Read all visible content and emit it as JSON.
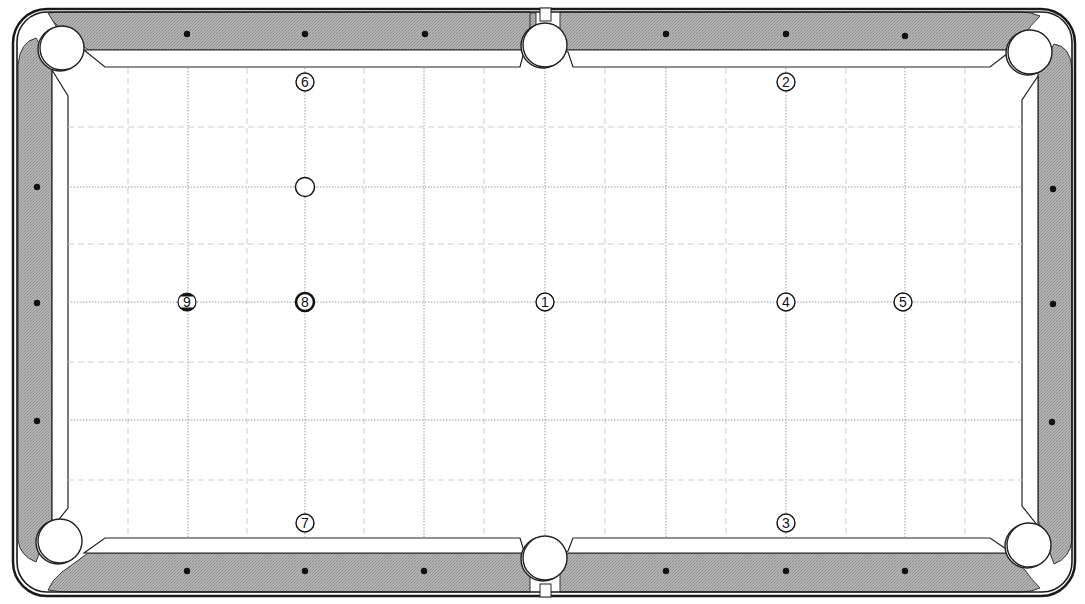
{
  "diagram": {
    "type": "pool-table-layout",
    "colors": {
      "rail": "#a8a8a8",
      "rail_dark": "#8c8c8c",
      "outline": "#1a1a1a",
      "cloth": "#ffffff",
      "grid_major": "#9a9a9a",
      "grid_minor": "#cfcfcf",
      "diamond": "#111111"
    },
    "table": {
      "playfield": {
        "x": 68,
        "y": 68,
        "w": 954,
        "h": 470
      },
      "grid": {
        "major_x": [
          188,
          305,
          424,
          545,
          666,
          786,
          905
        ],
        "minor_x": [
          128,
          247,
          364,
          484,
          605,
          726,
          846,
          965
        ],
        "major_y": [
          187,
          302,
          420
        ],
        "minor_y": [
          127,
          244,
          362,
          480
        ]
      },
      "diamonds": {
        "top": [
          [
            187,
            34
          ],
          [
            305,
            34
          ],
          [
            425,
            34
          ],
          [
            666,
            34
          ],
          [
            786,
            34
          ],
          [
            905,
            36
          ]
        ],
        "bottom": [
          [
            187,
            571
          ],
          [
            305,
            571
          ],
          [
            424,
            571
          ],
          [
            666,
            571
          ],
          [
            786,
            571
          ],
          [
            905,
            571
          ]
        ],
        "left": [
          [
            37,
            187
          ],
          [
            37,
            303
          ],
          [
            37,
            421
          ]
        ],
        "right": [
          [
            1053,
            189
          ],
          [
            1053,
            304
          ],
          [
            1052,
            422
          ]
        ]
      },
      "pockets": [
        {
          "name": "top-left",
          "cx": 62,
          "cy": 48,
          "r": 22
        },
        {
          "name": "top-side",
          "cx": 545,
          "cy": 45,
          "r": 22
        },
        {
          "name": "top-right",
          "cx": 1030,
          "cy": 52,
          "r": 22
        },
        {
          "name": "bottom-left",
          "cx": 60,
          "cy": 541,
          "r": 22
        },
        {
          "name": "bottom-side",
          "cx": 545,
          "cy": 558,
          "r": 22
        },
        {
          "name": "bottom-right",
          "cx": 1029,
          "cy": 545,
          "r": 22
        }
      ]
    },
    "balls": [
      {
        "label": "1",
        "x": 545,
        "y": 302,
        "style": "solid"
      },
      {
        "label": "2",
        "x": 786,
        "y": 82,
        "style": "solid"
      },
      {
        "label": "3",
        "x": 786,
        "y": 523,
        "style": "solid"
      },
      {
        "label": "4",
        "x": 786,
        "y": 302,
        "style": "solid"
      },
      {
        "label": "5",
        "x": 903,
        "y": 302,
        "style": "solid"
      },
      {
        "label": "6",
        "x": 305,
        "y": 82,
        "style": "solid"
      },
      {
        "label": "7",
        "x": 305,
        "y": 523,
        "style": "solid"
      },
      {
        "label": "8",
        "x": 305,
        "y": 302,
        "style": "eight"
      },
      {
        "label": "9",
        "x": 187,
        "y": 302,
        "style": "stripe"
      }
    ],
    "cue_ball": {
      "label": "",
      "x": 305,
      "y": 187
    }
  }
}
